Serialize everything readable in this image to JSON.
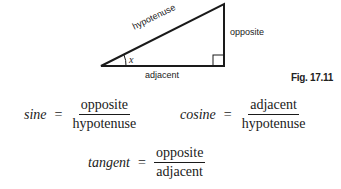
{
  "figure": {
    "label": "Fig. 17.11",
    "triangle": {
      "sides": {
        "hypotenuse": "hypotenuse",
        "opposite": "opposite",
        "adjacent": "adjacent"
      },
      "angle_label": "x",
      "right_angle_marker": true
    }
  },
  "equations": {
    "sine": {
      "name": "sine",
      "equals": "=",
      "numerator": "opposite",
      "denominator": "hypotenuse"
    },
    "cosine": {
      "name": "cosine",
      "equals": "=",
      "numerator": "adjacent",
      "denominator": "hypotenuse"
    },
    "tangent": {
      "name": "tangent",
      "equals": "=",
      "numerator": "opposite",
      "denominator": "adjacent"
    }
  }
}
